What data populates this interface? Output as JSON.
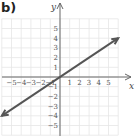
{
  "panel_label": "b)",
  "chart_data": {
    "type": "line",
    "title": "",
    "xlabel": "x",
    "ylabel": "y",
    "xlim": [
      -6,
      6
    ],
    "ylim": [
      -6,
      6
    ],
    "grid": true,
    "x_ticks": [
      "-5",
      "-4",
      "-3",
      "-2",
      "-1",
      "1",
      "2",
      "3",
      "4",
      "5"
    ],
    "y_ticks": [
      "5",
      "4",
      "3",
      "2",
      "1",
      "-1",
      "-2",
      "-3",
      "-4",
      "-5"
    ],
    "series": [
      {
        "name": "line",
        "equation": "y = (2/3)x",
        "x": [
          -6,
          6
        ],
        "y": [
          -4,
          4
        ],
        "arrows": "both",
        "color": "#555555"
      }
    ]
  }
}
